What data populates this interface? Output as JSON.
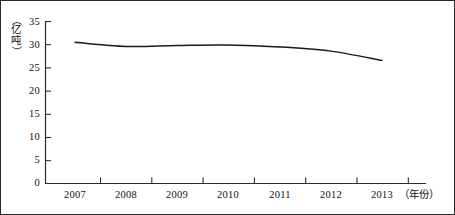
{
  "chart_data": {
    "type": "line",
    "title": "",
    "xlabel": "（年份）",
    "ylabel": "（亿吨）",
    "ylabel_chars": [
      "亿",
      "吨"
    ],
    "categories": [
      "2007",
      "2008",
      "2009",
      "2010",
      "2011",
      "2012",
      "2013"
    ],
    "x": [
      2007,
      2008,
      2009,
      2010,
      2011,
      2012,
      2013
    ],
    "values": [
      30.5,
      29.6,
      29.8,
      29.9,
      29.5,
      28.6,
      26.6
    ],
    "series": [
      {
        "name": "产量",
        "values": [
          30.5,
          29.6,
          29.8,
          29.9,
          29.5,
          28.6,
          26.6
        ]
      }
    ],
    "ylim": [
      0,
      35
    ],
    "yticks": [
      0,
      5,
      10,
      15,
      20,
      25,
      30,
      35
    ],
    "ytick_labels": [
      "0",
      "5",
      "10",
      "15",
      "20",
      "25",
      "30",
      "35"
    ],
    "grid": false,
    "legend": false,
    "legend_position": "none",
    "line_color": "#1a1a1a",
    "axis_color": "#2b2b2b",
    "background_color": "#ffffff",
    "units": "亿吨"
  }
}
